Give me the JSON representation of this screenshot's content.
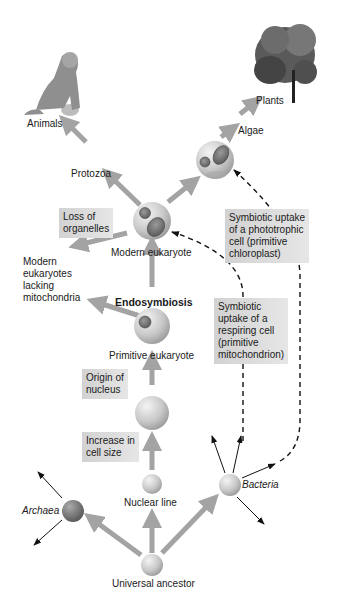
{
  "nodes": {
    "animals": "Animals",
    "plants": "Plants",
    "algae": "Algae",
    "protozoa": "Protozoa",
    "modern_eukaryote": "Modern eukaryote",
    "modern_lacking_1": "Modern",
    "modern_lacking_2": "eukaryotes",
    "modern_lacking_3": "lacking",
    "modern_lacking_4": "mitochondria",
    "endosymbiosis": "Endosymbiosis",
    "primitive_eukaryote": "Primitive eukaryote",
    "nuclear_line": "Nuclear line",
    "archaea": "Archaea",
    "bacteria": "Bacteria",
    "universal_ancestor": "Universal ancestor"
  },
  "boxes": {
    "loss_1": "Loss of",
    "loss_2": "organelles",
    "origin_1": "Origin of",
    "origin_2": "nucleus",
    "increase_1": "Increase in",
    "increase_2": "cell size",
    "photo_1": "Symbiotic uptake",
    "photo_2": "of a phototrophic",
    "photo_3": "cell (primitive",
    "photo_4": "chloroplast)",
    "resp_1": "Symbiotic",
    "resp_2": "uptake of a",
    "resp_3": "respiring cell",
    "resp_4": "(primitive",
    "resp_5": "mitochondrion)"
  },
  "colors": {
    "arrow": "#a3a3a3",
    "box": "#dcdcdc",
    "cell": "#cfcfcf",
    "archaea": "#7a7a7a"
  }
}
